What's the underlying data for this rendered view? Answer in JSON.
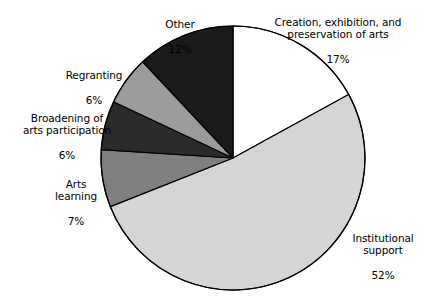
{
  "chart_data": {
    "type": "pie",
    "title": "",
    "subtitle": "",
    "xlabel": "",
    "ylabel": "",
    "legend_position": "none",
    "grid": false,
    "units": "percent",
    "total": 100,
    "start_angle_deg": 0,
    "direction": "clockwise",
    "categories": [
      "Creation, exhibition, and preservation of arts",
      "Institutional support",
      "Arts learning",
      "Broadening of arts participation",
      "Regranting",
      "Other"
    ],
    "values": [
      17,
      52,
      7,
      6,
      6,
      12
    ],
    "colors": [
      "#ffffff",
      "#d5d5d5",
      "#7f7f7f",
      "#2b2b2b",
      "#9b9b9b",
      "#1a1a1a"
    ],
    "slices": [
      {
        "name": "Creation, exhibition, and preservation of arts",
        "label_line1": "Creation, exhibition, and",
        "label_line2": "preservation of arts",
        "value": 17,
        "value_text": "17%",
        "color": "#ffffff",
        "start_deg": 0,
        "end_deg": 61.2
      },
      {
        "name": "Institutional support",
        "label_line1": "Institutional",
        "label_line2": "support",
        "value": 52,
        "value_text": "52%",
        "color": "#d5d5d5",
        "start_deg": 61.2,
        "end_deg": 248.4
      },
      {
        "name": "Arts learning",
        "label_line1": "Arts",
        "label_line2": "learning",
        "value": 7,
        "value_text": "7%",
        "color": "#7f7f7f",
        "start_deg": 248.4,
        "end_deg": 273.6
      },
      {
        "name": "Broadening of arts participation",
        "label_line1": "Broadening of",
        "label_line2": "arts participation",
        "value": 6,
        "value_text": "6%",
        "color": "#2b2b2b",
        "start_deg": 273.6,
        "end_deg": 295.2
      },
      {
        "name": "Regranting",
        "label_line1": "Regranting",
        "label_line2": "",
        "value": 6,
        "value_text": "6%",
        "color": "#9b9b9b",
        "start_deg": 295.2,
        "end_deg": 316.8
      },
      {
        "name": "Other",
        "label_line1": "Other",
        "label_line2": "",
        "value": 12,
        "value_text": "12%",
        "color": "#1a1a1a",
        "start_deg": 316.8,
        "end_deg": 360
      }
    ],
    "geometry": {
      "center_x": 233,
      "center_y": 158,
      "radius": 132,
      "stroke_color": "#000000",
      "stroke_width": 1.2
    }
  },
  "labels": {
    "creation": {
      "text": "Creation, exhibition, and\npreservation of arts",
      "value": "17%"
    },
    "institutional": {
      "text": "Institutional\nsupport",
      "value": "52%"
    },
    "arts_learning": {
      "text": "Arts\nlearning",
      "value": "7%"
    },
    "broadening": {
      "text": "Broadening of\narts participation",
      "value": "6%"
    },
    "regranting": {
      "text": "Regranting",
      "value": "6%"
    },
    "other": {
      "text": "Other",
      "value": "12%"
    }
  }
}
